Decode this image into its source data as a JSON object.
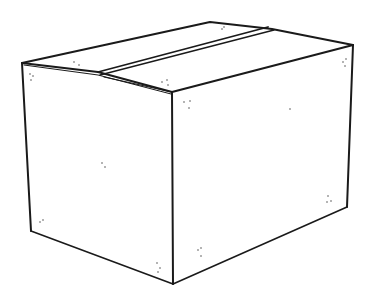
{
  "illustration": {
    "subject": "closed cardboard box",
    "style": "line drawing",
    "background_color": "#ffffff",
    "stroke_color": "#1a1a1a",
    "speck_color": "#555555",
    "vertices": {
      "top_front_left": [
        22,
        63
      ],
      "top_front_center": [
        172,
        92
      ],
      "top_back_right": [
        353,
        45
      ],
      "top_back_left": [
        210,
        22
      ],
      "bottom_left": [
        31,
        231
      ],
      "bottom_center": [
        173,
        284
      ],
      "bottom_right": [
        347,
        207
      ]
    },
    "flap_seam": {
      "left": [
        98,
        73
      ],
      "right": [
        273,
        29
      ]
    }
  }
}
